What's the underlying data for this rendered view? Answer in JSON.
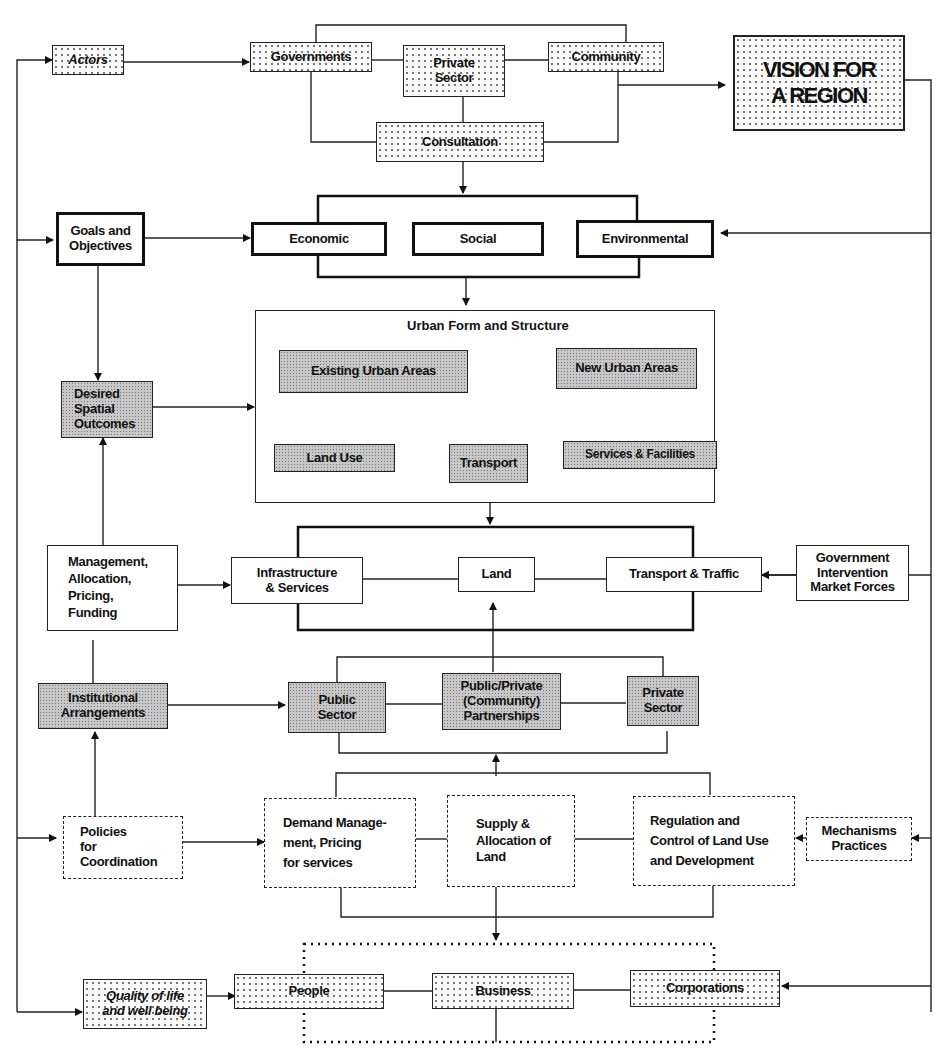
{
  "diagram": {
    "actors": "Actors",
    "governments": "Governments",
    "private_sector_top": "Private Sector",
    "community": "Community",
    "consultation": "Consultation",
    "vision": [
      "VISION FOR",
      "A REGION"
    ],
    "goals": [
      "Goals and",
      "Objectives"
    ],
    "economic": "Economic",
    "social": "Social",
    "environmental": "Environmental",
    "urban_form_title": "Urban Form and Structure",
    "existing_urban": "Existing Urban Areas",
    "new_urban": "New Urban Areas",
    "land_use": "Land Use",
    "transport_inner": "Transport",
    "services_facilities": "Services & Facilities",
    "desired_spatial": [
      "Desired",
      "Spatial",
      "Outcomes"
    ],
    "management": [
      "Management,",
      "Allocation,",
      "Pricing,",
      "Funding"
    ],
    "infrastructure": [
      "Infrastructure",
      "& Services"
    ],
    "land": "Land",
    "transport_traffic": "Transport & Traffic",
    "government_intervention": [
      "Government",
      "Intervention",
      "Market Forces"
    ],
    "institutional": [
      "Institutional",
      "Arrangements"
    ],
    "public_sector": [
      "Public",
      "Sector"
    ],
    "partnerships": [
      "Public/Private",
      "(Community)",
      "Partnerships"
    ],
    "private_sector_mid": [
      "Private",
      "Sector"
    ],
    "policies": [
      "Policies",
      "for",
      "Coordination"
    ],
    "demand_management": [
      "Demand Manage-",
      "ment, Pricing",
      "for services"
    ],
    "supply_allocation": [
      "Supply &",
      "Allocation of",
      "Land"
    ],
    "regulation": [
      "Regulation and",
      "Control of Land Use",
      "and Development"
    ],
    "mechanisms": [
      "Mechanisms",
      "Practices"
    ],
    "quality_of_life": [
      "Quality of life",
      "and well being"
    ],
    "people": "People",
    "business": "Business",
    "corporations": "Corporations"
  }
}
